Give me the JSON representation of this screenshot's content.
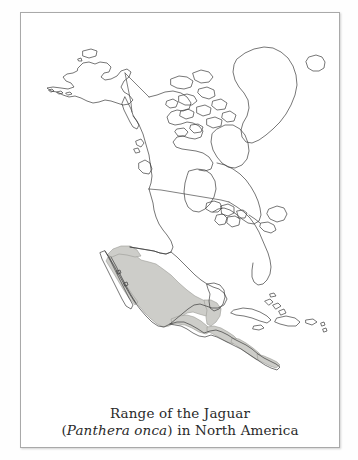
{
  "figure": {
    "caption_line1": "Range of the Jaguar",
    "caption_line2_open_paren": "(",
    "caption_line2_species": "Panthera onca",
    "caption_line2_close_paren": ")",
    "caption_line2_rest": " in North America",
    "frame_color": "#a9a9a9",
    "background_color": "#ffffff"
  },
  "map": {
    "title": "North America outline map",
    "coastline_color": "#3c3c3c",
    "border_line_color": "#4a4a4a",
    "range_fill_color": "#cdcdc9",
    "range_outline_color": "#8c8c8c",
    "projection_note": "North America, Greenland, Iceland and Caribbean",
    "landmasses": [
      "Alaska",
      "Aleutian Islands",
      "Canada",
      "Canadian Arctic Archipelago",
      "Baffin Island",
      "Greenland",
      "Iceland",
      "Vancouver Island",
      "United States",
      "Great Lakes",
      "Newfoundland",
      "Nova Scotia",
      "Florida",
      "Mexico",
      "Baja California",
      "Yucatan Peninsula",
      "Cuba",
      "Hispaniola",
      "Jamaica",
      "Puerto Rico",
      "Bahamas",
      "Central America",
      "Panama"
    ],
    "range_regions": [
      "Mexico",
      "Central America",
      "southwestern United States border"
    ]
  }
}
